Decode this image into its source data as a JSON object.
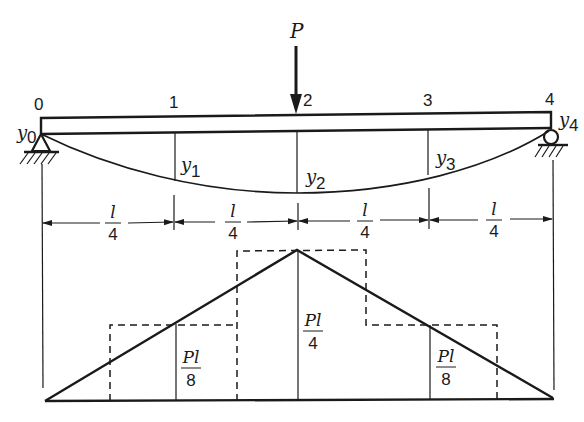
{
  "load": {
    "label": "P"
  },
  "nodes": [
    {
      "id": "0",
      "label": "0",
      "deflection": "y",
      "sub": "0"
    },
    {
      "id": "1",
      "label": "1",
      "deflection": "y",
      "sub": "1"
    },
    {
      "id": "2",
      "label": "2",
      "deflection": "y",
      "sub": "2"
    },
    {
      "id": "3",
      "label": "3",
      "deflection": "y",
      "sub": "3"
    },
    {
      "id": "4",
      "label": "4",
      "deflection": "y",
      "sub": "4"
    }
  ],
  "dimensions": [
    {
      "num": "l",
      "den": "4"
    },
    {
      "num": "l",
      "den": "4"
    },
    {
      "num": "l",
      "den": "4"
    },
    {
      "num": "l",
      "den": "4"
    }
  ],
  "moment_labels": [
    {
      "num": "Pl",
      "den": "8"
    },
    {
      "num": "Pl",
      "den": "4"
    },
    {
      "num": "Pl",
      "den": "8"
    }
  ]
}
